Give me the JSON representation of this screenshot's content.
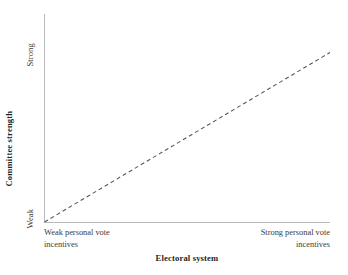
{
  "chart_data": {
    "type": "line",
    "title": "",
    "subtitle": "",
    "xlabel": "Electoral system",
    "ylabel": "Committee strength",
    "grid": false,
    "legend": null,
    "xlim": [
      0,
      1
    ],
    "ylim": [
      0,
      1
    ],
    "x_tick_labels": [
      "Weak personal vote incentives",
      "Strong personal vote incentives"
    ],
    "y_tick_labels": [
      "Weak",
      "Strong"
    ],
    "series": [
      {
        "name": "Expected relationship",
        "style": "dashed",
        "color": "#555555",
        "x": [
          0,
          1
        ],
        "values": [
          0,
          0.815
        ],
        "points": [
          {
            "x": 0,
            "y": 0
          },
          {
            "x": 1,
            "y": 0.815
          }
        ]
      }
    ],
    "annotations": []
  },
  "axes": {
    "y": {
      "title": "Committee strength",
      "tick_low": "Weak",
      "tick_high": "Strong"
    },
    "x": {
      "title": "Electoral system",
      "tick_low_line1": "Weak personal vote",
      "tick_low_line2": "incentives",
      "tick_high_line1": "Strong personal vote",
      "tick_high_line2": "incentives"
    }
  },
  "colors": {
    "axis_line": "#b9b9bb",
    "trend_line": "#555555",
    "text": "#2b2b2b",
    "background": "#ffffff"
  }
}
